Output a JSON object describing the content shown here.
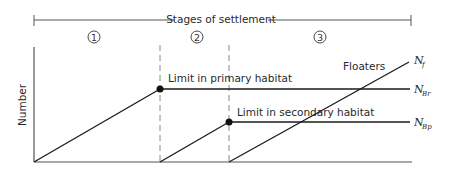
{
  "diagram": {
    "header": {
      "label": "Stages of settlement",
      "stages": [
        "1",
        "2",
        "3"
      ]
    },
    "y_axis": {
      "label": "Number"
    },
    "annotations": {
      "primary_limit": "Limit in primary habitat",
      "secondary_limit": "Limit in secondary habitat",
      "floaters": "Floaters"
    },
    "series": [
      {
        "name": "N_f",
        "main": "N",
        "sub": "f"
      },
      {
        "name": "N_Br",
        "main": "N",
        "sub": "Br"
      },
      {
        "name": "N_Bp",
        "main": "N",
        "sub": "Bp"
      }
    ],
    "colors": {
      "line": "#1a1a1a",
      "axis": "#555555",
      "dashed": "#888888",
      "text": "#2a2a2a"
    }
  }
}
